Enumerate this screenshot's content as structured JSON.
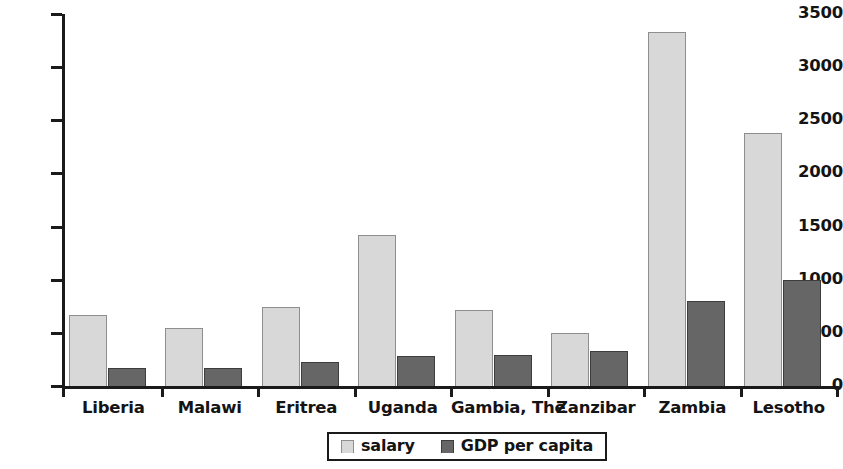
{
  "chart_data": {
    "type": "bar",
    "title": "",
    "subtitle": "",
    "xlabel": "",
    "ylabel": "",
    "ylim": [
      0,
      3500
    ],
    "ytick_step": 500,
    "yticks": [
      "0",
      "500",
      "1000",
      "1500",
      "2000",
      "2500",
      "3000",
      "3500"
    ],
    "grid": false,
    "legend_position": "bottom-center",
    "categories": [
      "Liberia",
      "Malawi",
      "Eritrea",
      "Uganda",
      "Gambia, The",
      "Zanzibar",
      "Zambia",
      "Lesotho"
    ],
    "series": [
      {
        "name": "salary",
        "color": "#d8d8d8",
        "border_color": "#8e8e8e",
        "values": [
          670,
          550,
          740,
          1425,
          715,
          495,
          3330,
          2385
        ]
      },
      {
        "name": "GDP per capita",
        "color": "#666666",
        "border_color": "#3d3d3d",
        "values": [
          165,
          165,
          225,
          280,
          290,
          330,
          800,
          1000
        ]
      }
    ]
  },
  "legend": {
    "items": [
      {
        "label": "salary",
        "swatch": "light-gray-square-swatch"
      },
      {
        "label": "GDP per capita",
        "swatch": "dark-gray-square-swatch"
      }
    ]
  }
}
